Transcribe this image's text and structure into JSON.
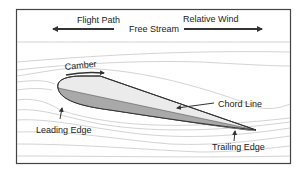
{
  "diagram": {
    "labels": {
      "flight_path": "Flight Path",
      "free_stream": "Free Stream",
      "relative_wind": "Relative Wind",
      "camber": "Camber",
      "chord_line": "Chord Line",
      "leading_edge": "Leading Edge",
      "trailing_edge": "Trailing Edge"
    },
    "colors": {
      "frame": "#444444",
      "arrow": "#333333",
      "streamline": "#c8c8c8",
      "airfoil_upper_fill": "#ebebeb",
      "airfoil_lower_fill": "#a9a9a9",
      "airfoil_outline": "#333333",
      "text": "#222222"
    },
    "icons": {
      "flight_path_arrow": "arrow-left",
      "relative_wind_arrow": "arrow-right",
      "camber_arrow": "arrow-right",
      "chord_line_pointer": "arrow-left",
      "leading_edge_pointer": "arrow-up",
      "trailing_edge_pointer": "arrow-up"
    }
  }
}
